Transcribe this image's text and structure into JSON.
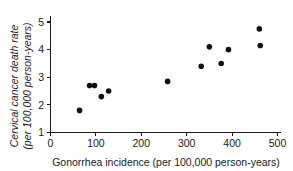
{
  "chart_data": {
    "type": "scatter",
    "title": "",
    "xlabel": "Gonorrhea incidence (per 100,000 person-years)",
    "ylabel_line1": "Cervical cancer death rate",
    "ylabel_line2": "(per 100,000 person-years)",
    "xlim": [
      0,
      500
    ],
    "ylim": [
      1,
      5
    ],
    "xticks": [
      0,
      100,
      200,
      300,
      400,
      500
    ],
    "yticks": [
      1,
      2,
      3,
      4,
      5
    ],
    "xtick_labels": [
      "0",
      "100",
      "200",
      "300",
      "400",
      "500"
    ],
    "ytick_labels": [
      "1",
      "2",
      "3",
      "4",
      "5"
    ],
    "grid": false,
    "legend": false,
    "marker_color": "#111111",
    "axis_color": "#1a1a1a",
    "points": [
      {
        "x": 64,
        "y": 1.8
      },
      {
        "x": 86,
        "y": 2.7
      },
      {
        "x": 97,
        "y": 2.7
      },
      {
        "x": 112,
        "y": 2.3
      },
      {
        "x": 128,
        "y": 2.5
      },
      {
        "x": 258,
        "y": 2.85
      },
      {
        "x": 332,
        "y": 3.4
      },
      {
        "x": 350,
        "y": 4.1
      },
      {
        "x": 376,
        "y": 3.5
      },
      {
        "x": 392,
        "y": 4.0
      },
      {
        "x": 460,
        "y": 4.75
      },
      {
        "x": 462,
        "y": 4.15
      }
    ]
  }
}
